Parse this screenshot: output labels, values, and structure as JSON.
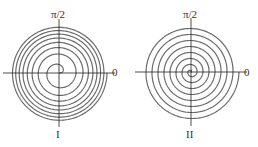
{
  "figures": [
    {
      "id": "I",
      "label": "I",
      "angle_label_top": "π/2",
      "angle_label_right": "0",
      "center": [
        59,
        73
      ],
      "radius": 48,
      "spiral_type": "decreasing-spacing (dense outside)",
      "turns": 8
    },
    {
      "id": "II",
      "label": "II",
      "angle_label_top": "π/2",
      "angle_label_right": "0",
      "center": [
        191,
        72
      ],
      "radius": 48,
      "spiral_type": "evenly spaced (Archimedean)",
      "turns": 8
    }
  ],
  "colors": {
    "spiral": "#6b6b6b",
    "axis": "#222222",
    "text": "#333333"
  }
}
